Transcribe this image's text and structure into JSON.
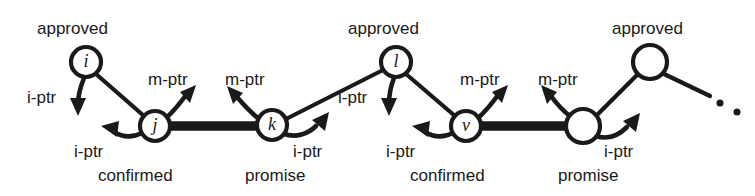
{
  "diagram": {
    "canvas": {
      "width": 755,
      "height": 196
    },
    "colors": {
      "ink": "#1a1a1a",
      "background": "#ffffff"
    },
    "nodes": [
      {
        "id": "i",
        "label": "i",
        "cx": 86,
        "cy": 62,
        "r": 15,
        "state": "approved"
      },
      {
        "id": "j",
        "label": "j",
        "cx": 155,
        "cy": 126,
        "r": 15,
        "state": "confirmed"
      },
      {
        "id": "k",
        "label": "k",
        "cx": 272,
        "cy": 125,
        "r": 15,
        "state": "promise"
      },
      {
        "id": "l",
        "label": "l",
        "cx": 396,
        "cy": 62,
        "r": 15,
        "state": "approved"
      },
      {
        "id": "v",
        "label": "v",
        "cx": 466,
        "cy": 126,
        "r": 15,
        "state": "confirmed"
      },
      {
        "id": "n6",
        "label": "",
        "cx": 583,
        "cy": 126,
        "r": 17,
        "state": "promise"
      },
      {
        "id": "n7",
        "label": "",
        "cx": 650,
        "cy": 62,
        "r": 17,
        "state": "approved"
      }
    ],
    "state_labels": [
      {
        "text": "approved",
        "x": 37,
        "y": 20
      },
      {
        "text": "confirmed",
        "x": 98,
        "y": 167
      },
      {
        "text": "promise",
        "x": 245,
        "y": 167
      },
      {
        "text": "approved",
        "x": 348,
        "y": 20
      },
      {
        "text": "confirmed",
        "x": 410,
        "y": 167
      },
      {
        "text": "promise",
        "x": 558,
        "y": 167
      },
      {
        "text": "approved",
        "x": 612,
        "y": 20
      }
    ],
    "pointer_labels": [
      {
        "text": "i-ptr",
        "x": 27,
        "y": 89
      },
      {
        "text": "i-ptr",
        "x": 74,
        "y": 143
      },
      {
        "text": "m-ptr",
        "x": 148,
        "y": 71
      },
      {
        "text": "m-ptr",
        "x": 225,
        "y": 71
      },
      {
        "text": "i-ptr",
        "x": 293,
        "y": 143
      },
      {
        "text": "i-ptr",
        "x": 338,
        "y": 89
      },
      {
        "text": "i-ptr",
        "x": 386,
        "y": 143
      },
      {
        "text": "m-ptr",
        "x": 460,
        "y": 71
      },
      {
        "text": "m-ptr",
        "x": 538,
        "y": 71
      },
      {
        "text": "i-ptr",
        "x": 604,
        "y": 143
      }
    ],
    "ellipsis_dots": [
      {
        "cx": 720,
        "cy": 103,
        "r": 3.5
      },
      {
        "cx": 737,
        "cy": 112,
        "r": 3.5
      }
    ],
    "edge_kinds": {
      "chain": "thick-main-chain-link",
      "link": "thin-parent-link",
      "pointer": "curved-pointer-arrow"
    }
  }
}
